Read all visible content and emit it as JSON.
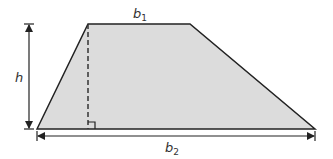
{
  "diagram": {
    "labels": {
      "top_base": "b",
      "top_base_sub": "1",
      "bottom_base": "b",
      "bottom_base_sub": "2",
      "height": "h"
    },
    "colors": {
      "fill": "#dcdcdc",
      "stroke": "#222222",
      "background": "#ffffff"
    }
  }
}
